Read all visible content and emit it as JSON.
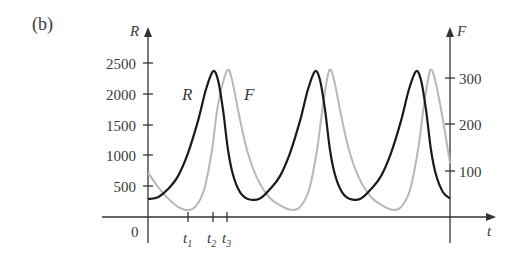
{
  "panel_label": "(b)",
  "chart_data": {
    "type": "line",
    "title": "",
    "xlabel": "t",
    "ylabel_left": "R",
    "ylabel_right": "F",
    "ylim_left": [
      0,
      2700
    ],
    "ylim_right": [
      0,
      350
    ],
    "yticks_left": [
      "0",
      "500",
      "1000",
      "1500",
      "2000",
      "2500"
    ],
    "yticks_right": [
      "100",
      "200",
      "300"
    ],
    "xticks": [
      {
        "label": "t",
        "sub": "1",
        "t": 40
      },
      {
        "label": "t",
        "sub": "2",
        "t": 65
      },
      {
        "label": "t",
        "sub": "3",
        "t": 79
      }
    ],
    "origin_label": "0",
    "xlim": [
      0,
      302
    ],
    "grid": false,
    "legend": "inline curve labels",
    "series": [
      {
        "name": "R",
        "axis": "left",
        "color": "#1a1a1a",
        "points": [
          [
            0,
            290
          ],
          [
            10,
            320
          ],
          [
            20,
            450
          ],
          [
            30,
            660
          ],
          [
            40,
            1030
          ],
          [
            50,
            1550
          ],
          [
            58,
            2060
          ],
          [
            65,
            2350
          ],
          [
            70,
            2210
          ],
          [
            75,
            1730
          ],
          [
            80,
            1080
          ],
          [
            85,
            680
          ],
          [
            92,
            400
          ],
          [
            100,
            290
          ],
          [
            112,
            300
          ],
          [
            122,
            450
          ],
          [
            132,
            660
          ],
          [
            142,
            1030
          ],
          [
            152,
            1550
          ],
          [
            160,
            2060
          ],
          [
            167,
            2350
          ],
          [
            172,
            2210
          ],
          [
            177,
            1730
          ],
          [
            182,
            1080
          ],
          [
            187,
            680
          ],
          [
            194,
            400
          ],
          [
            202,
            290
          ],
          [
            213,
            300
          ],
          [
            223,
            450
          ],
          [
            233,
            660
          ],
          [
            243,
            1030
          ],
          [
            253,
            1550
          ],
          [
            261,
            2060
          ],
          [
            268,
            2350
          ],
          [
            273,
            2210
          ],
          [
            278,
            1730
          ],
          [
            283,
            1080
          ],
          [
            288,
            680
          ],
          [
            295,
            400
          ],
          [
            302,
            300
          ]
        ]
      },
      {
        "name": "F",
        "axis": "right",
        "color": "#b8b8b8",
        "points": [
          [
            0,
            95
          ],
          [
            10,
            65
          ],
          [
            20,
            40
          ],
          [
            30,
            22
          ],
          [
            40,
            15
          ],
          [
            48,
            24
          ],
          [
            56,
            58
          ],
          [
            64,
            144
          ],
          [
            70,
            241
          ],
          [
            79,
            314
          ],
          [
            84,
            295
          ],
          [
            91,
            220
          ],
          [
            99,
            144
          ],
          [
            109,
            84
          ],
          [
            121,
            43
          ],
          [
            133,
            24
          ],
          [
            145,
            15
          ],
          [
            153,
            24
          ],
          [
            161,
            58
          ],
          [
            169,
            144
          ],
          [
            175,
            241
          ],
          [
            181,
            314
          ],
          [
            186,
            295
          ],
          [
            193,
            220
          ],
          [
            201,
            144
          ],
          [
            211,
            84
          ],
          [
            223,
            43
          ],
          [
            235,
            24
          ],
          [
            246,
            15
          ],
          [
            254,
            24
          ],
          [
            262,
            58
          ],
          [
            270,
            144
          ],
          [
            276,
            241
          ],
          [
            282,
            314
          ],
          [
            287,
            295
          ],
          [
            294,
            220
          ],
          [
            302,
            116
          ]
        ]
      }
    ],
    "annotations": [
      {
        "text": "R",
        "near": "first R peak, left"
      },
      {
        "text": "F",
        "near": "first F peak, right"
      }
    ]
  }
}
